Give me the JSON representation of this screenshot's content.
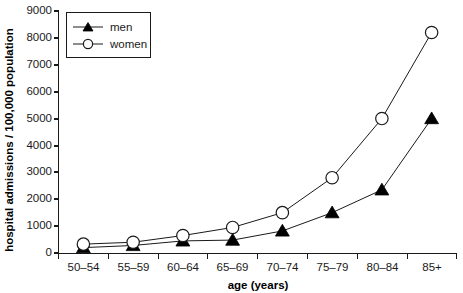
{
  "chart_data": {
    "type": "line",
    "title": "",
    "xlabel": "age (years)",
    "ylabel": "hospital admissions / 100,000 population",
    "categories": [
      "50–54",
      "55–59",
      "60–64",
      "65–69",
      "70–74",
      "75–79",
      "80–84",
      "85+"
    ],
    "ylim": [
      0,
      9000
    ],
    "yticks": [
      0,
      1000,
      2000,
      3000,
      4000,
      5000,
      6000,
      7000,
      8000,
      9000
    ],
    "ytick_labels": [
      "0",
      "1000",
      "2000",
      "3000",
      "4000",
      "5000",
      "6000",
      "7000",
      "8000",
      "9000"
    ],
    "grid": false,
    "legend_position": "top-left",
    "series": [
      {
        "name": "men",
        "marker": "filled-triangle",
        "values": [
          200,
          280,
          450,
          480,
          820,
          1500,
          2350,
          5000
        ]
      },
      {
        "name": "women",
        "marker": "open-circle",
        "values": [
          330,
          400,
          650,
          950,
          1500,
          2800,
          5000,
          8200
        ]
      }
    ]
  },
  "legend": {
    "entries": [
      {
        "label": "men"
      },
      {
        "label": "women"
      }
    ]
  },
  "colors": {
    "axis": "#1a1a1a",
    "line": "#1a1a1a",
    "men_marker_fill": "#000000",
    "women_marker_fill": "#ffffff",
    "background": "#ffffff"
  }
}
